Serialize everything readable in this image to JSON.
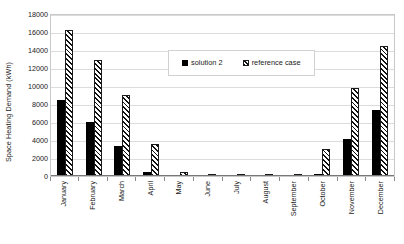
{
  "chart_data": {
    "type": "bar",
    "title": "",
    "xlabel": "",
    "ylabel": "Space Heating Demand (kWh)",
    "ylim": [
      0,
      18000
    ],
    "ytick_step": 2000,
    "yticks": [
      "18000",
      "16000",
      "14000",
      "12000",
      "10000",
      "8000",
      "6000",
      "4000",
      "2000",
      "0"
    ],
    "grid": true,
    "grid_axis": "y",
    "legend_position": "upper center",
    "categories": [
      "January",
      "February",
      "March",
      "April",
      "May",
      "June",
      "July",
      "August",
      "September",
      "October",
      "November",
      "December"
    ],
    "series": [
      {
        "name": "solution 2",
        "style": "solid-black",
        "color": "#000000",
        "values": [
          8400,
          6000,
          3300,
          500,
          0,
          0,
          0,
          0,
          60,
          250,
          4150,
          7350
        ]
      },
      {
        "name": "reference case",
        "style": "diagonal-hatch",
        "color": "#ffffff",
        "values": [
          16200,
          12850,
          9050,
          3550,
          450,
          0,
          0,
          0,
          150,
          2950,
          9750,
          14400
        ]
      }
    ]
  },
  "legend": {
    "entries": [
      {
        "label": "solution 2"
      },
      {
        "label": "reference case"
      }
    ]
  },
  "colors": {
    "plot_border": "#c8c8c8",
    "gridline": "#dcdcdc",
    "axis": "#777777",
    "text": "#1a1a1a",
    "series_solid": "#000000",
    "series_hatch_bg": "#ffffff"
  }
}
